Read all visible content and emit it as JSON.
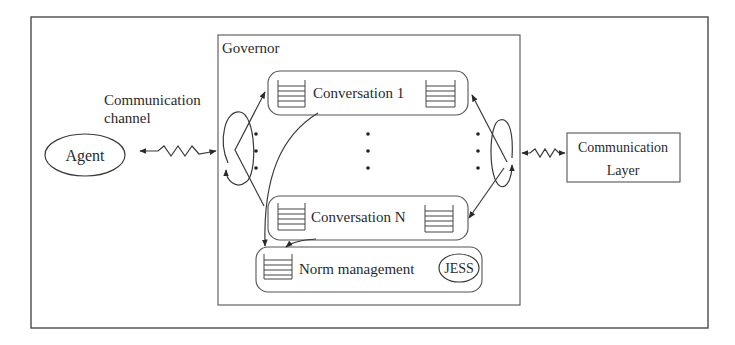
{
  "diagram": {
    "governor": {
      "label": "Governor"
    },
    "conversations": [
      {
        "label": "Conversation 1"
      },
      {
        "label": "Conversation N"
      }
    ],
    "ellipsis_marker": "⋮",
    "norm_management": {
      "label": "Norm management",
      "engine": "JESS"
    },
    "agent": {
      "label": "Agent"
    },
    "channel": {
      "line1": "Communication",
      "line2": "channel"
    },
    "communication_layer": {
      "line1": "Communication",
      "line2": "Layer"
    },
    "colors": {
      "stroke": "#3a3a3a",
      "text": "#2a2a2a",
      "background": "#ffffff"
    }
  }
}
